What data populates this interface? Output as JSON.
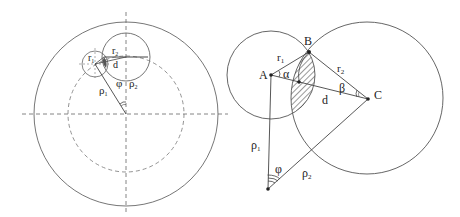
{
  "left_figure": {
    "labels": {
      "r1": "r",
      "r1_sub": "1",
      "r2": "r",
      "r2_sub": "2",
      "d": "d",
      "rho1": "ρ",
      "rho1_sub": "1",
      "rho2": "ρ",
      "rho2_sub": "2",
      "phi": "φ"
    }
  },
  "right_figure": {
    "labels": {
      "A": "A",
      "B": "B",
      "C": "C",
      "r1": "r",
      "r1_sub": "1",
      "r2": "r",
      "r2_sub": "2",
      "alpha": "α",
      "beta": "β",
      "d": "d",
      "rho1": "ρ",
      "rho1_sub": "1",
      "rho2": "ρ",
      "rho2_sub": "2",
      "phi": "φ"
    }
  },
  "colors": {
    "line": "#555555",
    "dashed": "#666666",
    "text": "#222222"
  }
}
